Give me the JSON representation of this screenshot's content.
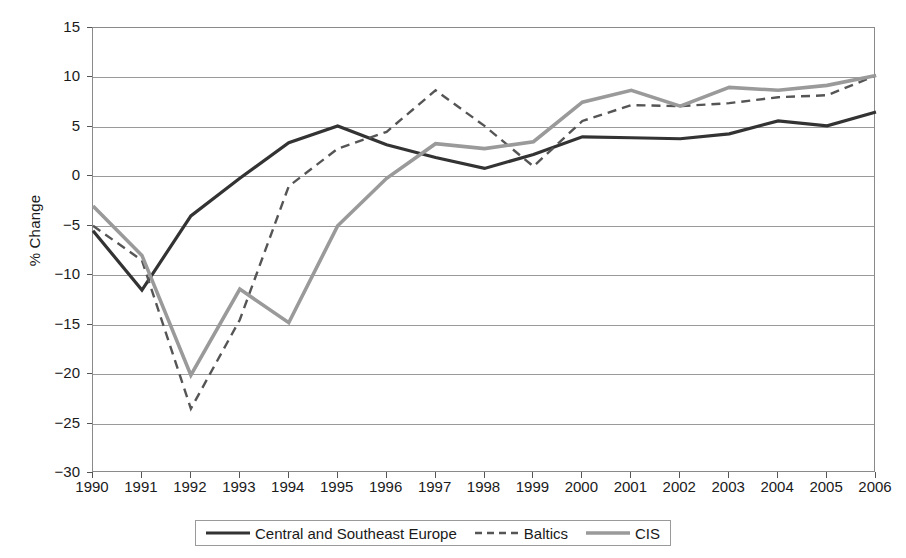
{
  "chart_data": {
    "type": "line",
    "title": "",
    "xlabel": "",
    "ylabel": "% Change",
    "x": [
      1990,
      1991,
      1992,
      1993,
      1994,
      1995,
      1996,
      1997,
      1998,
      1999,
      2000,
      2001,
      2002,
      2003,
      2004,
      2005,
      2006
    ],
    "categories": [
      "1990",
      "1991",
      "1992",
      "1993",
      "1994",
      "1995",
      "1996",
      "1997",
      "1998",
      "1999",
      "2000",
      "2001",
      "2002",
      "2003",
      "2004",
      "2005",
      "2006"
    ],
    "xlim": [
      1990,
      2006
    ],
    "ylim": [
      -30,
      15
    ],
    "yticks": [
      15,
      10,
      5,
      0,
      -5,
      -10,
      -15,
      -20,
      -25,
      -30
    ],
    "ytick_labels": [
      "15",
      "10",
      "5",
      "0",
      "−5",
      "−10",
      "−15",
      "−20",
      "−25",
      "−30"
    ],
    "grid": "horizontal",
    "legend_position": "bottom",
    "series": [
      {
        "name": "Central and Southeast Europe",
        "style": "solid",
        "color": "#333333",
        "width": 3.2,
        "values": [
          -5.5,
          -11.5,
          -4.0,
          -0.2,
          3.4,
          5.1,
          3.2,
          1.9,
          0.8,
          2.2,
          4.0,
          3.9,
          3.8,
          4.3,
          5.6,
          5.1,
          6.5
        ]
      },
      {
        "name": "Baltics",
        "style": "dashed",
        "color": "#555555",
        "width": 2.4,
        "values": [
          -5.0,
          -8.5,
          -23.5,
          -14.5,
          -1.0,
          2.8,
          4.5,
          8.7,
          5.1,
          1.0,
          5.6,
          7.2,
          7.1,
          7.4,
          8.0,
          8.2,
          10.2
        ]
      },
      {
        "name": "CIS",
        "style": "solid",
        "color": "#9a9a9a",
        "width": 3.6,
        "values": [
          -3.0,
          -8.0,
          -20.1,
          -11.4,
          -14.8,
          -5.0,
          -0.2,
          3.3,
          2.8,
          3.5,
          7.5,
          8.7,
          7.1,
          9.0,
          8.7,
          9.2,
          10.2
        ]
      }
    ]
  },
  "axis": {
    "y_title": "% Change"
  },
  "legend": {
    "entries": [
      {
        "label": "Central and Southeast Europe",
        "icon": "solid-dark-line-icon"
      },
      {
        "label": "Baltics",
        "icon": "dashed-line-icon"
      },
      {
        "label": "CIS",
        "icon": "solid-gray-line-icon"
      }
    ]
  }
}
